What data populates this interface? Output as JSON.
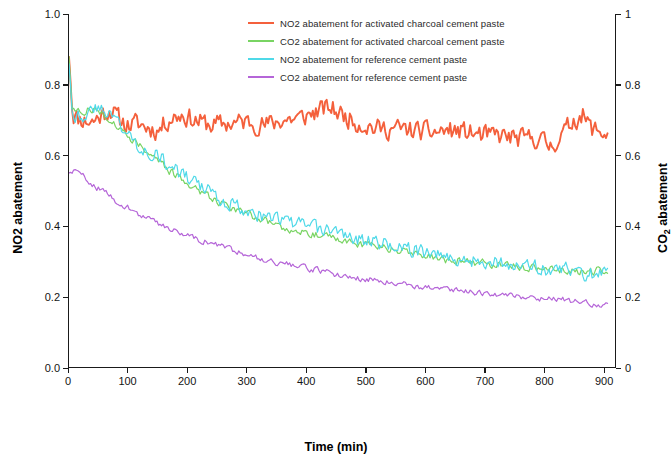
{
  "chart_data": {
    "type": "line",
    "title": "",
    "xlabel": "Time (min)",
    "ylabel_left": "NO2 abatement",
    "ylabel_right": "CO2 abatement",
    "ylabel_right_main": "CO",
    "ylabel_right_sub": "2",
    "ylabel_right_tail": " abatement",
    "xlim": [
      0,
      920
    ],
    "ylim_left": [
      0.0,
      1.0
    ],
    "ylim_right": [
      0.0,
      1.0
    ],
    "grid": false,
    "legend_position": "top-center",
    "xticks": [
      {
        "value": 0,
        "label": "0"
      },
      {
        "value": 100,
        "label": "100"
      },
      {
        "value": 200,
        "label": "200"
      },
      {
        "value": 300,
        "label": "300"
      },
      {
        "value": 400,
        "label": "400"
      },
      {
        "value": 500,
        "label": "500"
      },
      {
        "value": 600,
        "label": "600"
      },
      {
        "value": 700,
        "label": "700"
      },
      {
        "value": 800,
        "label": "800"
      },
      {
        "value": 900,
        "label": "900"
      }
    ],
    "yticks_left": [
      {
        "value": 0.0,
        "label": "0.0"
      },
      {
        "value": 0.2,
        "label": "0.2"
      },
      {
        "value": 0.4,
        "label": "0.4"
      },
      {
        "value": 0.6,
        "label": "0.6"
      },
      {
        "value": 0.8,
        "label": "0.8"
      },
      {
        "value": 1.0,
        "label": "1.0"
      }
    ],
    "yticks_right": [
      {
        "value": 0.0,
        "label": "0"
      },
      {
        "value": 0.2,
        "label": "0.2"
      },
      {
        "value": 0.4,
        "label": "0.4"
      },
      {
        "value": 0.6,
        "label": "0.6"
      },
      {
        "value": 0.8,
        "label": "0.8"
      },
      {
        "value": 1.0,
        "label": "1"
      }
    ],
    "series": [
      {
        "name": "NO2 abatement for activated charcoal cement paste",
        "color": "#f4603c",
        "axis": "left",
        "noise": 0.03,
        "seed": 11,
        "points": [
          [
            0,
            0.88
          ],
          [
            6,
            0.72
          ],
          [
            14,
            0.705
          ],
          [
            25,
            0.7
          ],
          [
            40,
            0.695
          ],
          [
            55,
            0.715
          ],
          [
            70,
            0.73
          ],
          [
            85,
            0.7
          ],
          [
            100,
            0.685
          ],
          [
            115,
            0.69
          ],
          [
            130,
            0.68
          ],
          [
            150,
            0.67
          ],
          [
            170,
            0.705
          ],
          [
            190,
            0.715
          ],
          [
            210,
            0.7
          ],
          [
            240,
            0.685
          ],
          [
            270,
            0.69
          ],
          [
            300,
            0.695
          ],
          [
            330,
            0.685
          ],
          [
            360,
            0.7
          ],
          [
            390,
            0.705
          ],
          [
            420,
            0.725
          ],
          [
            440,
            0.735
          ],
          [
            460,
            0.715
          ],
          [
            490,
            0.69
          ],
          [
            520,
            0.675
          ],
          [
            550,
            0.675
          ],
          [
            580,
            0.67
          ],
          [
            610,
            0.665
          ],
          [
            640,
            0.67
          ],
          [
            670,
            0.665
          ],
          [
            700,
            0.655
          ],
          [
            730,
            0.655
          ],
          [
            760,
            0.645
          ],
          [
            790,
            0.65
          ],
          [
            810,
            0.625
          ],
          [
            830,
            0.655
          ],
          [
            850,
            0.7
          ],
          [
            865,
            0.715
          ],
          [
            880,
            0.675
          ],
          [
            900,
            0.665
          ],
          [
            910,
            0.655
          ]
        ]
      },
      {
        "name": "CO2 abatement for activated charcoal cement paste",
        "color": "#79d463",
        "axis": "right",
        "noise": 0.012,
        "seed": 27,
        "points": [
          [
            0,
            0.88
          ],
          [
            5,
            0.735
          ],
          [
            14,
            0.72
          ],
          [
            25,
            0.725
          ],
          [
            40,
            0.73
          ],
          [
            55,
            0.72
          ],
          [
            70,
            0.7
          ],
          [
            85,
            0.675
          ],
          [
            100,
            0.655
          ],
          [
            115,
            0.635
          ],
          [
            130,
            0.615
          ],
          [
            150,
            0.585
          ],
          [
            170,
            0.555
          ],
          [
            190,
            0.53
          ],
          [
            210,
            0.51
          ],
          [
            240,
            0.48
          ],
          [
            270,
            0.455
          ],
          [
            300,
            0.435
          ],
          [
            330,
            0.415
          ],
          [
            360,
            0.395
          ],
          [
            390,
            0.385
          ],
          [
            420,
            0.375
          ],
          [
            450,
            0.365
          ],
          [
            480,
            0.35
          ],
          [
            510,
            0.345
          ],
          [
            540,
            0.335
          ],
          [
            570,
            0.325
          ],
          [
            600,
            0.315
          ],
          [
            630,
            0.305
          ],
          [
            660,
            0.3
          ],
          [
            690,
            0.295
          ],
          [
            720,
            0.29
          ],
          [
            750,
            0.285
          ],
          [
            780,
            0.28
          ],
          [
            810,
            0.275
          ],
          [
            840,
            0.27
          ],
          [
            870,
            0.27
          ],
          [
            900,
            0.275
          ],
          [
            910,
            0.27
          ]
        ]
      },
      {
        "name": "NO2 abatement for reference cement paste",
        "color": "#4fd9e8",
        "axis": "left",
        "noise": 0.022,
        "seed": 43,
        "points": [
          [
            0,
            0.86
          ],
          [
            6,
            0.72
          ],
          [
            14,
            0.71
          ],
          [
            25,
            0.715
          ],
          [
            40,
            0.725
          ],
          [
            55,
            0.735
          ],
          [
            70,
            0.72
          ],
          [
            85,
            0.69
          ],
          [
            100,
            0.655
          ],
          [
            115,
            0.63
          ],
          [
            130,
            0.615
          ],
          [
            150,
            0.6
          ],
          [
            170,
            0.565
          ],
          [
            190,
            0.545
          ],
          [
            210,
            0.525
          ],
          [
            240,
            0.49
          ],
          [
            270,
            0.465
          ],
          [
            300,
            0.445
          ],
          [
            330,
            0.425
          ],
          [
            360,
            0.415
          ],
          [
            390,
            0.405
          ],
          [
            420,
            0.39
          ],
          [
            450,
            0.385
          ],
          [
            480,
            0.365
          ],
          [
            510,
            0.355
          ],
          [
            540,
            0.345
          ],
          [
            570,
            0.335
          ],
          [
            600,
            0.325
          ],
          [
            630,
            0.315
          ],
          [
            660,
            0.305
          ],
          [
            690,
            0.3
          ],
          [
            720,
            0.295
          ],
          [
            750,
            0.29
          ],
          [
            780,
            0.285
          ],
          [
            810,
            0.275
          ],
          [
            840,
            0.275
          ],
          [
            870,
            0.265
          ],
          [
            900,
            0.265
          ],
          [
            910,
            0.26
          ]
        ]
      },
      {
        "name": "CO2 abatement for reference cement paste",
        "color": "#b565d8",
        "axis": "right",
        "noise": 0.009,
        "seed": 59,
        "points": [
          [
            0,
            0.55
          ],
          [
            10,
            0.555
          ],
          [
            20,
            0.545
          ],
          [
            35,
            0.525
          ],
          [
            50,
            0.505
          ],
          [
            65,
            0.49
          ],
          [
            80,
            0.47
          ],
          [
            95,
            0.455
          ],
          [
            110,
            0.44
          ],
          [
            125,
            0.425
          ],
          [
            140,
            0.415
          ],
          [
            160,
            0.4
          ],
          [
            180,
            0.385
          ],
          [
            200,
            0.375
          ],
          [
            220,
            0.36
          ],
          [
            250,
            0.345
          ],
          [
            280,
            0.33
          ],
          [
            310,
            0.315
          ],
          [
            340,
            0.3
          ],
          [
            370,
            0.29
          ],
          [
            400,
            0.28
          ],
          [
            430,
            0.27
          ],
          [
            460,
            0.26
          ],
          [
            490,
            0.25
          ],
          [
            520,
            0.245
          ],
          [
            550,
            0.24
          ],
          [
            580,
            0.23
          ],
          [
            610,
            0.225
          ],
          [
            640,
            0.22
          ],
          [
            670,
            0.215
          ],
          [
            700,
            0.21
          ],
          [
            730,
            0.205
          ],
          [
            760,
            0.2
          ],
          [
            790,
            0.195
          ],
          [
            820,
            0.195
          ],
          [
            850,
            0.185
          ],
          [
            880,
            0.18
          ],
          [
            900,
            0.175
          ],
          [
            910,
            0.18
          ]
        ]
      }
    ]
  }
}
